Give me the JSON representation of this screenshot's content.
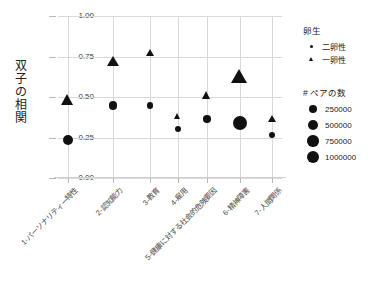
{
  "chart_data": {
    "type": "scatter",
    "title": "",
    "xlabel": "",
    "ylabel": "双子の相関",
    "ylim": [
      0.0,
      1.0
    ],
    "yticks": [
      "0.00",
      "0.25",
      "0.50",
      "0.75",
      "1.00"
    ],
    "ytick_values": [
      0.0,
      0.25,
      0.5,
      0.75,
      1.0
    ],
    "grid": true,
    "legend_position": "right",
    "categories": [
      "1-パーソナリティー特性",
      "2-認知能力",
      "3-教育",
      "4-雇用",
      "5-健康に対する社会的危険要因",
      "6-精神障害",
      "7-人間関係"
    ],
    "series": [
      {
        "name": "二卵性",
        "marker": "circle",
        "values": [
          0.235,
          0.445,
          0.45,
          0.3,
          0.365,
          0.34,
          0.265
        ],
        "sizes": [
          420000,
          300000,
          130000,
          90000,
          180000,
          1000000,
          120000
        ]
      },
      {
        "name": "一卵性",
        "marker": "triangle",
        "values": [
          0.475,
          0.715,
          0.77,
          0.375,
          0.505,
          0.615,
          0.36
        ],
        "sizes": [
          520000,
          420000,
          140000,
          100000,
          190000,
          1000000,
          130000
        ]
      }
    ]
  },
  "legend_shape": {
    "title": "卵生",
    "items": [
      {
        "label": "二卵性",
        "marker": "circle"
      },
      {
        "label": "一卵性",
        "marker": "triangle"
      }
    ]
  },
  "legend_size": {
    "title": "# ペアの数",
    "items": [
      {
        "label": "250000",
        "value": 250000
      },
      {
        "label": "500000",
        "value": 500000
      },
      {
        "label": "750000",
        "value": 750000
      },
      {
        "label": "1000000",
        "value": 1000000
      }
    ]
  },
  "colors": {
    "marker": "#111111",
    "grid": "#d9d9d9",
    "text": "#222222",
    "background": "#ffffff"
  }
}
